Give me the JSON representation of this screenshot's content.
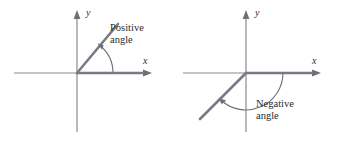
{
  "figure": {
    "background_color": "#ffffff",
    "width": 339,
    "height": 142
  },
  "style": {
    "axis_color": "#8a8a8f",
    "ray_color": "#7a7a84",
    "arc_color": "#6f6f78",
    "text_color": "#2b2b2b"
  },
  "panels": [
    {
      "id": "positive-angle",
      "origin": {
        "x": 77,
        "y": 73
      },
      "axis_label_y": "y",
      "axis_label_x": "x",
      "angle_label_line1": "Positive",
      "angle_label_line2": "angle",
      "rotation_direction": "counterclockwise",
      "terminal_angle_degrees": 50,
      "initial_side_direction": "positive-x"
    },
    {
      "id": "negative-angle",
      "origin": {
        "x": 77,
        "y": 73
      },
      "axis_label_y": "y",
      "axis_label_x": "x",
      "angle_label_line1": "Negative",
      "angle_label_line2": "angle",
      "rotation_direction": "clockwise",
      "terminal_angle_degrees": -145,
      "initial_side_direction": "positive-x"
    }
  ]
}
